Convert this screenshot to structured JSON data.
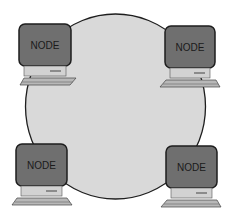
{
  "diagram": {
    "type": "ring-network-topology",
    "ring": {
      "fill": "#d9d9d9",
      "stroke": "#1e1e1e"
    },
    "nodes": [
      {
        "id": "top-left",
        "label": "NODE"
      },
      {
        "id": "top-right",
        "label": "NODE"
      },
      {
        "id": "bottom-left",
        "label": "NODE"
      },
      {
        "id": "bottom-right",
        "label": "NODE"
      }
    ],
    "colors": {
      "monitor_fill": "#6f6f6f",
      "monitor_stroke": "#1e1e1e",
      "base_fill": "#d2d2d2",
      "keyboard_fill": "#b8b8b8"
    }
  }
}
